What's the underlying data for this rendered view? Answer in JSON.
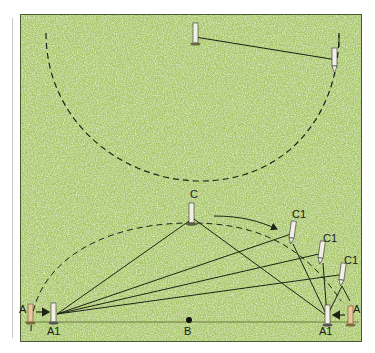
{
  "figure": {
    "colors": {
      "grass": "#a9c86a",
      "grass_light": "#d6e6a8",
      "grass_dark": "#7fa442",
      "line": "#1e2416",
      "stake": "#f1efe6",
      "stake_old": "#e8c99a",
      "border": "#4a5a32"
    },
    "labels": {
      "a_left": "A",
      "a_right": "A",
      "a1_left": "A1",
      "a1_right": "A1",
      "b": "B",
      "c": "C",
      "c1_top": "C1",
      "c1_mid": "C1",
      "c1_low": "C1"
    }
  }
}
